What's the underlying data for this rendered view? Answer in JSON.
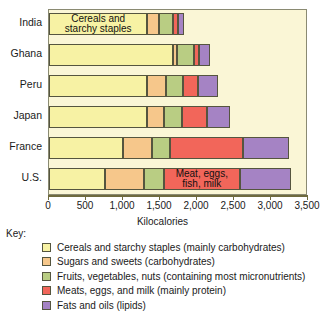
{
  "chart_data": {
    "type": "bar",
    "orientation": "horizontal",
    "stacked": true,
    "title": "",
    "xlabel": "Kilocalories",
    "ylabel": "",
    "xlim": [
      0,
      3500
    ],
    "xticks": [
      0,
      500,
      1000,
      1500,
      2000,
      2500,
      3000,
      3500
    ],
    "xticklabels": [
      "0",
      "500",
      "1,000",
      "1,500",
      "2,000",
      "2,500",
      "3,000",
      "3,500"
    ],
    "grid": false,
    "legend_position": "below-plot",
    "categories": [
      "India",
      "Ghana",
      "Peru",
      "Japan",
      "France",
      "U.S."
    ],
    "series": [
      {
        "name": "Cereals and starchy staples",
        "color": "#f7f2a4",
        "values": [
          1330,
          1680,
          1330,
          1330,
          1000,
          750
        ]
      },
      {
        "name": "Sugars and sweets",
        "color": "#f6c78b",
        "values": [
          150,
          50,
          250,
          230,
          390,
          540
        ]
      },
      {
        "name": "Fruits, vegetables, nuts",
        "color": "#b9cd83",
        "values": [
          190,
          230,
          230,
          240,
          240,
          260
        ]
      },
      {
        "name": "Meats, eggs, and milk",
        "color": "#f2665a",
        "values": [
          70,
          70,
          200,
          340,
          990,
          1030
        ]
      },
      {
        "name": "Fats and oils",
        "color": "#a583c4",
        "values": [
          90,
          140,
          270,
          310,
          630,
          690
        ]
      }
    ],
    "annotations": [
      {
        "text": "Cereals and\nstarchy staples",
        "category": "India",
        "series": "Cereals and starchy staples"
      },
      {
        "text": "Meat, eggs,\nfish, milk",
        "category": "U.S.",
        "series": "Meats, eggs, and milk"
      }
    ]
  },
  "key": {
    "title": "Key:",
    "entries": [
      {
        "color": "#f7f2a4",
        "label": "Cereals and starchy staples (mainly carbohydrates)"
      },
      {
        "color": "#f6c78b",
        "label": "Sugars and sweets (carbohydrates)"
      },
      {
        "color": "#b9cd83",
        "label": "Fruits, vegetables, nuts (containing most micronutrients)"
      },
      {
        "color": "#f2665a",
        "label": "Meats, eggs, and milk (mainly protein)"
      },
      {
        "color": "#a583c4",
        "label": "Fats and oils (lipids)"
      }
    ]
  },
  "colors": {
    "plot_background": "#faf6d6",
    "plot_border": "#8a8a72",
    "axis": "#6e6a3e",
    "segment_border": "#55553f",
    "text": "#1a1a1a"
  }
}
